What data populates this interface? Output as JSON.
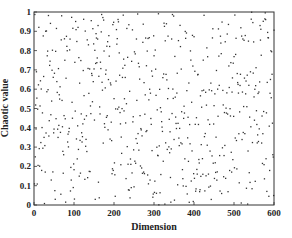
{
  "chart_data": {
    "type": "scatter",
    "title": "",
    "xlabel": "Dimension",
    "ylabel": "Chaotic value",
    "xlim": [
      0,
      600
    ],
    "ylim": [
      0,
      1
    ],
    "xticks": [
      0,
      100,
      200,
      300,
      400,
      500,
      600
    ],
    "yticks": [
      0,
      0.1,
      0.2,
      0.3,
      0.4,
      0.5,
      0.6,
      0.7,
      0.8,
      0.9,
      1
    ],
    "ytick_labels": [
      "0",
      "0.1",
      "0.2",
      "0.3",
      "0.4",
      "0.5",
      "0.6",
      "0.7",
      "0.8",
      "0.9",
      "1"
    ],
    "grid": false,
    "legend": null,
    "n_points": 600,
    "distribution": "approximately uniform chaotic sequence in [0,1] over dimensions 1-600",
    "marker_color": "#333333",
    "marker_size": 1
  }
}
